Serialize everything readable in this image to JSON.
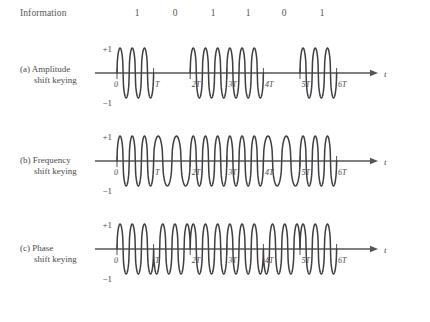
{
  "figure": {
    "information_label": "Information",
    "bits": [
      "1",
      "0",
      "1",
      "1",
      "0",
      "1"
    ],
    "time_axis_label": "t",
    "amplitude_labels": {
      "top": "+1",
      "bottom": "−1"
    },
    "tick_labels": [
      "0",
      "T",
      "2T",
      "3T",
      "4T",
      "5T",
      "6T"
    ],
    "panels": [
      {
        "id": "ask",
        "tag": "(a)",
        "line1": "(a) Amplitude",
        "line2": "shift keying",
        "name": "Amplitude shift keying"
      },
      {
        "id": "fsk",
        "tag": "(b)",
        "line1": "(b) Frequency",
        "line2": "shift keying",
        "name": "Frequency shift keying"
      },
      {
        "id": "psk",
        "tag": "(c)",
        "line1": "(c) Phase",
        "line2": "shift keying",
        "name": "Phase shift keying"
      }
    ],
    "colors": {
      "waveform": "#3f3f3f",
      "axis": "#555555",
      "text": "#4a4a4a",
      "background": "#ffffff"
    }
  },
  "chart_data": {
    "type": "line",
    "xlabel": "t",
    "ylabel": "",
    "ylim": [
      -1,
      1
    ],
    "xlim": [
      0,
      6
    ],
    "grid": false,
    "legend": "none",
    "x_tick_labels": [
      "0",
      "T",
      "2T",
      "3T",
      "4T",
      "5T",
      "6T"
    ],
    "x_tick_values": [
      0,
      1,
      2,
      3,
      4,
      5,
      6
    ],
    "y_tick_labels": [
      "+1",
      "−1"
    ],
    "y_tick_values": [
      1,
      -1
    ],
    "information_bits": [
      1,
      0,
      1,
      1,
      0,
      1
    ],
    "bit_period": 1,
    "annotations": [
      "Information"
    ],
    "series": [
      {
        "name": "Amplitude shift keying",
        "panel": "a",
        "carrier_cycles_per_bit": 3,
        "amplitude_for_bit_1": 1,
        "amplitude_for_bit_0": 0,
        "segments": [
          {
            "bit": 1,
            "start": 0,
            "end": 1,
            "cycles": 3,
            "amplitude": 1
          },
          {
            "bit": 0,
            "start": 1,
            "end": 2,
            "cycles": 0,
            "amplitude": 0
          },
          {
            "bit": 1,
            "start": 2,
            "end": 3,
            "cycles": 3,
            "amplitude": 1
          },
          {
            "bit": 1,
            "start": 3,
            "end": 4,
            "cycles": 3,
            "amplitude": 1
          },
          {
            "bit": 0,
            "start": 4,
            "end": 5,
            "cycles": 0,
            "amplitude": 0
          },
          {
            "bit": 1,
            "start": 5,
            "end": 6,
            "cycles": 3,
            "amplitude": 1
          }
        ]
      },
      {
        "name": "Frequency shift keying",
        "panel": "b",
        "cycles_for_bit_1": 3,
        "cycles_for_bit_0": 2,
        "amplitude": 1,
        "segments": [
          {
            "bit": 1,
            "start": 0,
            "end": 1,
            "cycles": 3,
            "amplitude": 1
          },
          {
            "bit": 0,
            "start": 1,
            "end": 2,
            "cycles": 2,
            "amplitude": 1
          },
          {
            "bit": 1,
            "start": 2,
            "end": 3,
            "cycles": 3,
            "amplitude": 1
          },
          {
            "bit": 1,
            "start": 3,
            "end": 4,
            "cycles": 3,
            "amplitude": 1
          },
          {
            "bit": 0,
            "start": 4,
            "end": 5,
            "cycles": 2,
            "amplitude": 1
          },
          {
            "bit": 1,
            "start": 5,
            "end": 6,
            "cycles": 3,
            "amplitude": 1
          }
        ]
      },
      {
        "name": "Phase shift keying",
        "panel": "c",
        "carrier_cycles_per_bit": 3,
        "amplitude": 1,
        "phase_for_bit_1_deg": 0,
        "phase_for_bit_0_deg": 180,
        "segments": [
          {
            "bit": 1,
            "start": 0,
            "end": 1,
            "cycles": 3,
            "amplitude": 1,
            "phase_deg": 0
          },
          {
            "bit": 0,
            "start": 1,
            "end": 2,
            "cycles": 3,
            "amplitude": 1,
            "phase_deg": 180
          },
          {
            "bit": 1,
            "start": 2,
            "end": 3,
            "cycles": 3,
            "amplitude": 1,
            "phase_deg": 0
          },
          {
            "bit": 1,
            "start": 3,
            "end": 4,
            "cycles": 3,
            "amplitude": 1,
            "phase_deg": 0
          },
          {
            "bit": 0,
            "start": 4,
            "end": 5,
            "cycles": 3,
            "amplitude": 1,
            "phase_deg": 180
          },
          {
            "bit": 1,
            "start": 5,
            "end": 6,
            "cycles": 3,
            "amplitude": 1,
            "phase_deg": 0
          }
        ]
      }
    ]
  }
}
